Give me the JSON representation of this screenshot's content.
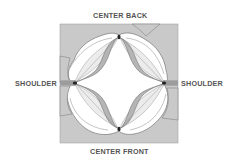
{
  "diagram": {
    "labels": {
      "top": "CENTER BACK",
      "bottom": "CENTER FRONT",
      "left": "SHOULDER",
      "right": "SHOULDER"
    },
    "colors": {
      "background_square": "#c9c9c9",
      "fabric": "#ffffff",
      "petal_band": "#b5b5b5",
      "petal_fill": "#ececec",
      "outline": "#777777",
      "text": "#555555"
    }
  }
}
